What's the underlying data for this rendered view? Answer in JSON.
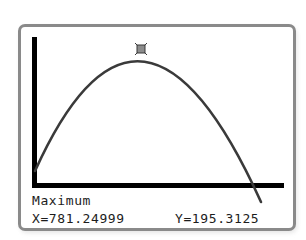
{
  "screen": {
    "mode_label": "Maximum",
    "x_readout": "X=781.24999",
    "y_readout": "Y=195.3125"
  },
  "colors": {
    "frame_border": "#8a8a8a",
    "curve": "#3a3a3a",
    "axes": "#000000",
    "marker_fill": "#8c8c8c",
    "marker_border": "#3a3a3a",
    "text": "#1c1c1c",
    "background": "#ffffff"
  },
  "graph": {
    "function_shape": "downward-parabola",
    "maximum_point": {
      "x": 781.24999,
      "y": 195.3125
    },
    "marker_icon": "square-trace-cursor"
  }
}
